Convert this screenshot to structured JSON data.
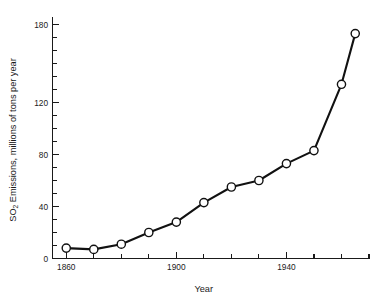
{
  "chart_data": {
    "type": "line",
    "title": "",
    "subtitle": "",
    "xlabel": "Year",
    "ylabel": "SO2 Emissions, millions of tons per year",
    "ylabel_parts": {
      "pre": "SO",
      "sub": "2",
      "post": " Emissions, millions of tons per year"
    },
    "xlim": [
      1855,
      1970
    ],
    "ylim": [
      0,
      185
    ],
    "grid": false,
    "legend": "none",
    "x_ticks_major": [
      1860,
      1900,
      1940
    ],
    "x_tick_labels": [
      "1860",
      "1900",
      "1940"
    ],
    "x_ticks_all": [
      1860,
      1870,
      1880,
      1890,
      1900,
      1910,
      1920,
      1930,
      1940,
      1950,
      1960,
      1970
    ],
    "y_ticks_major": [
      0,
      40,
      80,
      120,
      180
    ],
    "y_tick_labels": [
      "0",
      "40",
      "80",
      "120",
      "180"
    ],
    "y_ticks_all": [
      0,
      10,
      20,
      30,
      40,
      50,
      60,
      70,
      80,
      90,
      100,
      110,
      120,
      130,
      140,
      150,
      160,
      170,
      180
    ],
    "marker": "open-circle",
    "line_color": "#111111",
    "marker_fill": "#ffffff",
    "x": [
      1860,
      1870,
      1880,
      1890,
      1900,
      1910,
      1920,
      1930,
      1940,
      1950,
      1960,
      1965
    ],
    "values": [
      8,
      7,
      11,
      20,
      28,
      43,
      55,
      60,
      73,
      83,
      134,
      173
    ],
    "points": [
      {
        "year": 1860,
        "emissions": 8
      },
      {
        "year": 1870,
        "emissions": 7
      },
      {
        "year": 1880,
        "emissions": 11
      },
      {
        "year": 1890,
        "emissions": 20
      },
      {
        "year": 1900,
        "emissions": 28
      },
      {
        "year": 1910,
        "emissions": 43
      },
      {
        "year": 1920,
        "emissions": 55
      },
      {
        "year": 1930,
        "emissions": 60
      },
      {
        "year": 1940,
        "emissions": 73
      },
      {
        "year": 1950,
        "emissions": 83
      },
      {
        "year": 1960,
        "emissions": 134
      },
      {
        "year": 1965,
        "emissions": 173
      }
    ]
  }
}
